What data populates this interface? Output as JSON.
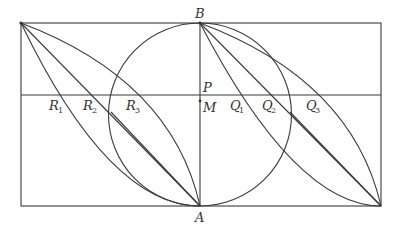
{
  "figure": {
    "type": "geometry-diagram",
    "labels": {
      "A": "A",
      "B": "B",
      "P": "P",
      "M": "M",
      "R1": {
        "letter": "R",
        "sub": "1"
      },
      "R2": {
        "letter": "R",
        "sub": "2"
      },
      "R3": {
        "letter": "R",
        "sub": "3"
      },
      "Q1": {
        "letter": "Q",
        "sub": "1"
      },
      "Q2": {
        "letter": "Q",
        "sub": "2"
      },
      "Q3": {
        "letter": "Q",
        "sub": "3"
      }
    },
    "colors": {
      "stroke": "#3a3a3a",
      "background": "#ffffff"
    }
  }
}
